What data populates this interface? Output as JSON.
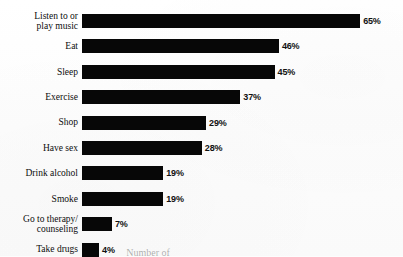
{
  "chart_data": {
    "type": "bar",
    "orientation": "horizontal",
    "title": "",
    "xlabel": "",
    "ylabel": "",
    "xlim": [
      0,
      70
    ],
    "grid": false,
    "legend": null,
    "categories": [
      "Listen to or\nplay music",
      "Eat",
      "Sleep",
      "Exercise",
      "Shop",
      "Have sex",
      "Drink alcohol",
      "Smoke",
      "Go to therapy/\ncounseling",
      "Take drugs"
    ],
    "values": [
      65,
      46,
      45,
      37,
      29,
      28,
      19,
      19,
      7,
      4
    ],
    "value_labels": [
      "65%",
      "46%",
      "45%",
      "37%",
      "29%",
      "28%",
      "19%",
      "19%",
      "7%",
      "4%"
    ],
    "bar_color": "#070707",
    "background_color": "#fdfdfd"
  },
  "caption": {
    "cutoff_text": "Number of"
  }
}
